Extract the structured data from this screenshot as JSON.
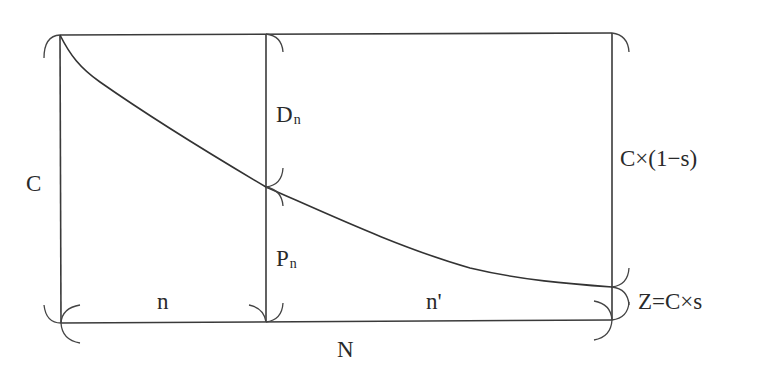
{
  "title_fragment": "（截断的标题文字）",
  "diagram": {
    "type": "geometric-schematic",
    "stroke_color": "#3a3a3a",
    "geometry": {
      "left_x": 60,
      "mid_x": 266,
      "right_x": 612,
      "top_y": 34,
      "bottom_y": 322,
      "curve_mid_y": 187,
      "curve_end_y": 287
    }
  },
  "labels": {
    "c_left": "C",
    "d_n_main": "D",
    "d_n_sub": "n",
    "p_n_main": "P",
    "p_n_sub": "n",
    "n_segment": "n",
    "n_prime_segment": "n'",
    "n_total": "N",
    "c_times_one_minus_s": "C×(1−s)",
    "z_equals_c_times_s": "Z=C×s"
  }
}
